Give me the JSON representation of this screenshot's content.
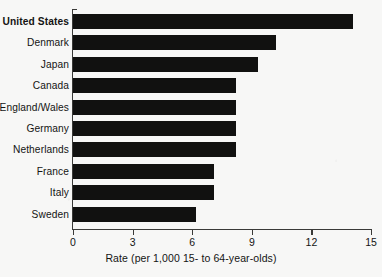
{
  "chart_data": {
    "type": "bar",
    "orientation": "horizontal",
    "title": "",
    "subtitle": "",
    "xlabel": "Rate (per 1,000 15- to 64-year-olds)",
    "ylabel": "",
    "xlim": [
      0,
      15
    ],
    "xticks": [
      0,
      3,
      6,
      9,
      12,
      15
    ],
    "xtick_labels": [
      "0",
      "3",
      "6",
      "9",
      "12",
      "15"
    ],
    "grid": false,
    "legend": null,
    "bar_color": "#111110",
    "background_color": "#f7f7f6",
    "axis_color": "#3a3a38",
    "highlighted_category": "United States",
    "categories": [
      "United States",
      "Denmark",
      "Japan",
      "Canada",
      "England/Wales",
      "Germany",
      "Netherlands",
      "France",
      "Italy",
      "Sweden"
    ],
    "values": [
      14.1,
      10.2,
      9.3,
      8.2,
      8.2,
      8.2,
      8.2,
      7.1,
      7.1,
      6.2
    ],
    "bars": [
      {
        "label": "United States",
        "value": 14.1,
        "bold": true
      },
      {
        "label": "Denmark",
        "value": 10.2,
        "bold": false
      },
      {
        "label": "Japan",
        "value": 9.3,
        "bold": false
      },
      {
        "label": "Canada",
        "value": 8.2,
        "bold": false
      },
      {
        "label": "England/Wales",
        "value": 8.2,
        "bold": false
      },
      {
        "label": "Germany",
        "value": 8.2,
        "bold": false
      },
      {
        "label": "Netherlands",
        "value": 8.2,
        "bold": false
      },
      {
        "label": "France",
        "value": 7.1,
        "bold": false
      },
      {
        "label": "Italy",
        "value": 7.1,
        "bold": false
      },
      {
        "label": "Sweden",
        "value": 6.2,
        "bold": false
      }
    ]
  }
}
